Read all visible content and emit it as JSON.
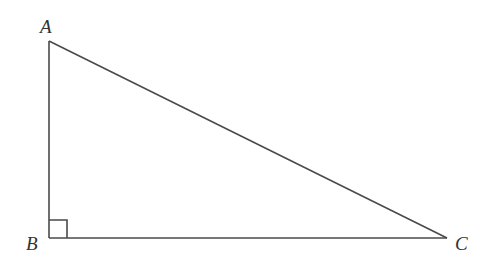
{
  "diagram": {
    "type": "right-triangle",
    "vertices": [
      {
        "label": "A",
        "x": 49,
        "y": 41
      },
      {
        "label": "B",
        "x": 49,
        "y": 238
      },
      {
        "label": "C",
        "x": 447,
        "y": 238
      }
    ],
    "right_angle_at": "B",
    "labels": {
      "a": "A",
      "b": "B",
      "c": "C"
    },
    "stroke_color": "#4a4a4a"
  }
}
